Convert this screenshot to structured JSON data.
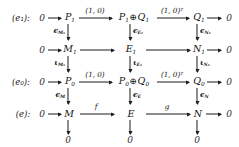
{
  "figure": {
    "kind": "commutative-diagram",
    "ink_color": "#1d1d1d",
    "background_color": "#ffffff"
  },
  "row_labels": {
    "r1": "(e₁):",
    "r2": "",
    "r3": "(e₀):",
    "r4": "(e):"
  },
  "zeros": {
    "left": "0",
    "right": "0",
    "bottom": "0"
  },
  "objects": {
    "r1": {
      "c1": "P",
      "c1sub": "1",
      "c2a": "P",
      "c2asub": "1",
      "c2b": "Q",
      "c2bsub": "1",
      "c3": "Q",
      "c3sub": "1"
    },
    "r2": {
      "c1": "M",
      "c1sub": "1",
      "c2": "E",
      "c2sub": "1",
      "c3": "N",
      "c3sub": "1"
    },
    "r3": {
      "c1": "P",
      "c1sub": "0",
      "c2a": "P",
      "c2asub": "0",
      "c2b": "Q",
      "c2bsub": "0",
      "c3": "Q",
      "c3sub": "0"
    },
    "r4": {
      "c1": "M",
      "c2": "E",
      "c3": "N"
    }
  },
  "horizontal_maps": {
    "r1_left": "(1, 0)",
    "r1_right_base": "(1, 0)",
    "r1_right_exp": "T",
    "r2_left": "",
    "r2_right": "",
    "r3_left": "(1, 0)",
    "r3_right_base": "(1, 0)",
    "r3_right_exp": "T",
    "r4_left": "f",
    "r4_right": "g"
  },
  "vertical_maps": {
    "eps_M1": {
      "glyph": "ϵ",
      "sub": "M₁"
    },
    "eps_E1": {
      "glyph": "ϵ",
      "sub": "E₁"
    },
    "eps_N1": {
      "glyph": "ϵ",
      "sub": "N₁"
    },
    "iota_M1": {
      "glyph": "ι",
      "sub": "M₁"
    },
    "iota_E1": {
      "glyph": "ι",
      "sub": "E₁"
    },
    "iota_N1": {
      "glyph": "ι",
      "sub": "N₁"
    },
    "eps_M": {
      "glyph": "ϵ",
      "sub": "M"
    },
    "eps_E": {
      "glyph": "ϵ",
      "sub": "E"
    },
    "eps_N": {
      "glyph": "ϵ",
      "sub": "N"
    }
  },
  "symbols": {
    "direct_sum": "⊕"
  }
}
